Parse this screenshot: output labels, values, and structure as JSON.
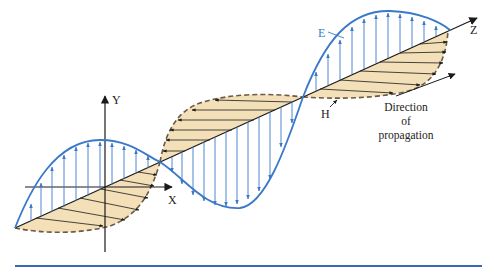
{
  "figure": {
    "labels": {
      "y_axis": "Y",
      "x_axis": "X",
      "z_axis": "Z",
      "electric_field": "E",
      "magnetic_field": "H",
      "direction_line1": "Direction",
      "direction_line2": "of",
      "direction_line3": "propagation"
    },
    "colors": {
      "electric_field": "#3a78c8",
      "magnetic_fill": "#f3dfb8",
      "magnetic_outline": "#6b5a45",
      "axes": "#1a1a1a",
      "bottom_rule": "#3a67b8"
    }
  }
}
